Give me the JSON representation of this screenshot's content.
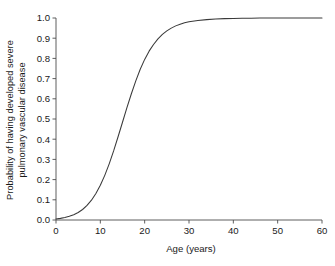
{
  "chart_data": {
    "type": "line",
    "title": "",
    "xlabel": "Age (years)",
    "ylabel": "Probability of having developed severe\npulmonary vascular disease",
    "xlim": [
      0,
      60
    ],
    "ylim": [
      0.0,
      1.0
    ],
    "grid": false,
    "legend": null,
    "line_color": "#3a3a3a",
    "axis_color": "#4d4d4d",
    "xticks": [
      "0",
      "10",
      "20",
      "30",
      "40",
      "50",
      "60"
    ],
    "xtick_values": [
      0,
      10,
      20,
      30,
      40,
      50,
      60
    ],
    "yticks": [
      "0.0",
      "0.1",
      "0.2",
      "0.3",
      "0.4",
      "0.5",
      "0.6",
      "0.7",
      "0.8",
      "0.9",
      "1.0"
    ],
    "ytick_values": [
      0.0,
      0.1,
      0.2,
      0.3,
      0.4,
      0.5,
      0.6,
      0.7,
      0.8,
      0.9,
      1.0
    ],
    "series": [
      {
        "name": "Probability of severe pulmonary vascular disease",
        "x": [
          0,
          1,
          2,
          3,
          4,
          5,
          6,
          7,
          8,
          9,
          10,
          11,
          12,
          13,
          14,
          15,
          16,
          17,
          18,
          19,
          20,
          21,
          22,
          23,
          24,
          25,
          26,
          27,
          28,
          29,
          30,
          32,
          34,
          36,
          38,
          40,
          42,
          44,
          46,
          48,
          50,
          52,
          54,
          56,
          58,
          60
        ],
        "y": [
          0.005,
          0.008,
          0.012,
          0.018,
          0.026,
          0.037,
          0.052,
          0.072,
          0.098,
          0.131,
          0.172,
          0.221,
          0.278,
          0.342,
          0.412,
          0.484,
          0.556,
          0.625,
          0.689,
          0.746,
          0.795,
          0.836,
          0.869,
          0.897,
          0.919,
          0.936,
          0.95,
          0.961,
          0.969,
          0.976,
          0.981,
          0.988,
          0.992,
          0.995,
          0.997,
          0.998,
          0.999,
          0.999,
          1.0,
          1.0,
          1.0,
          1.0,
          1.0,
          1.0,
          1.0,
          1.0
        ]
      }
    ]
  }
}
